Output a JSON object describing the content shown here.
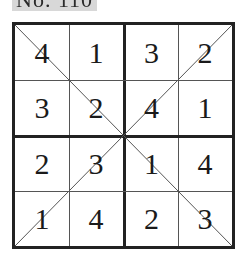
{
  "title": "No. 110",
  "puzzle": {
    "type": "diagonal-sudoku-4x4",
    "grid": [
      [
        "4",
        "1",
        "3",
        "2"
      ],
      [
        "3",
        "2",
        "4",
        "1"
      ],
      [
        "2",
        "3",
        "1",
        "4"
      ],
      [
        "1",
        "4",
        "2",
        "3"
      ]
    ]
  },
  "colors": {
    "border": "#222222",
    "thin_line": "#555555",
    "digit": "#1a1a1a",
    "diagonal": "#555555"
  }
}
